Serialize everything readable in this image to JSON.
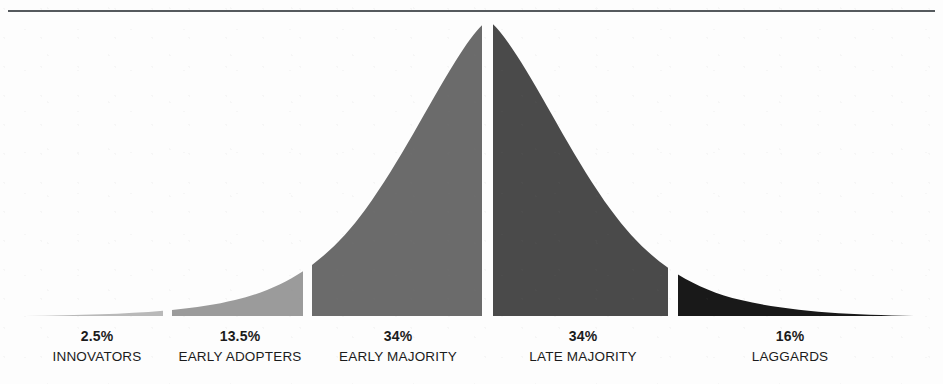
{
  "chart_data": {
    "type": "area",
    "title": "",
    "subtitle": "",
    "xlabel": "",
    "ylabel": "",
    "grid": false,
    "legend_position": "below-segments",
    "categories": [
      "INNOVATORS",
      "EARLY ADOPTERS",
      "EARLY MAJORITY",
      "LATE MAJORITY",
      "LAGGARDS"
    ],
    "values": [
      2.5,
      13.5,
      34,
      34,
      16
    ],
    "value_labels": [
      "2.5%",
      "13.5%",
      "34%",
      "34%",
      "16%"
    ],
    "segments": [
      {
        "label": "INNOVATORS",
        "percent_label": "2.5%",
        "value": 2.5,
        "color": "#b9b9b9",
        "x_start": 25,
        "x_end": 163,
        "label_center": 97
      },
      {
        "label": "EARLY ADOPTERS",
        "percent_label": "13.5%",
        "value": 13.5,
        "color": "#9b9b9b",
        "x_start": 172,
        "x_end": 303,
        "label_center": 240
      },
      {
        "label": "EARLY MAJORITY",
        "percent_label": "34%",
        "value": 34,
        "color": "#6b6b6b",
        "x_start": 312,
        "x_end": 482,
        "label_center": 398
      },
      {
        "label": "LATE MAJORITY",
        "percent_label": "34%",
        "value": 34,
        "color": "#4a4a4a",
        "x_start": 493,
        "x_end": 668,
        "label_center": 583
      },
      {
        "label": "LAGGARDS",
        "percent_label": "16%",
        "value": 16,
        "color": "#191919",
        "x_start": 678,
        "x_end": 925,
        "label_center": 790
      }
    ],
    "curve": {
      "baseline_y": 316,
      "peak_y": 20,
      "peak_x": 488,
      "x_min": 25,
      "x_max": 925
    },
    "rule": {
      "color": "#555a5e",
      "x_start": 8,
      "x_end": 935,
      "y": 10
    }
  }
}
